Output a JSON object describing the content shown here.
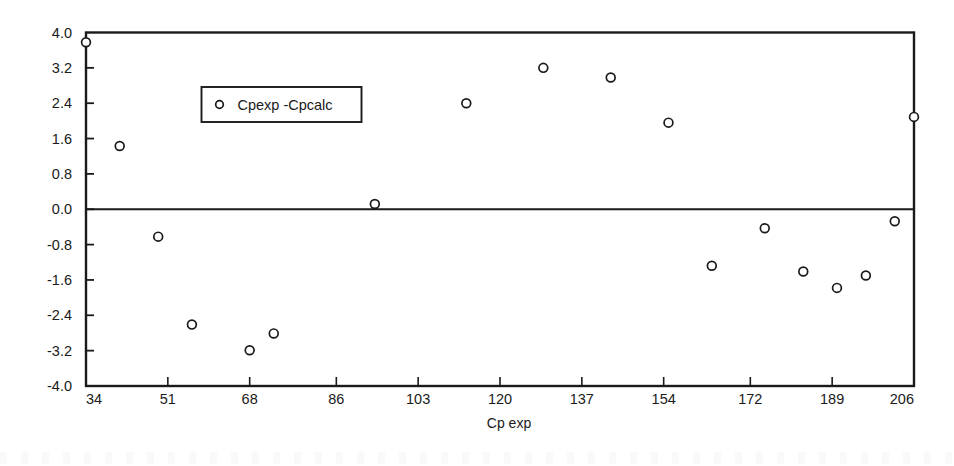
{
  "chart_data": {
    "type": "scatter",
    "title": "",
    "xlabel": "Cp exp",
    "ylabel": "",
    "xlim": [
      34,
      206
    ],
    "ylim": [
      -4.0,
      4.0
    ],
    "grid": false,
    "legend_position": "upper-left-inside",
    "xticks": [
      34,
      51,
      68,
      86,
      103,
      120,
      137,
      154,
      172,
      189,
      206
    ],
    "xticklabels": [
      "34",
      "51",
      "68",
      "86",
      "103",
      "120",
      "137",
      "154",
      "172",
      "189",
      "206"
    ],
    "yticks": [
      4.0,
      3.2,
      2.4,
      1.6,
      0.8,
      0.0,
      -0.8,
      -1.6,
      -2.4,
      -3.2,
      -4.0
    ],
    "yticklabels": [
      "4.0",
      "3.2",
      "2.4",
      "1.6",
      "0.8",
      "0.0",
      "-0.8",
      "-1.6",
      "-2.4",
      "-3.2",
      "-4.0"
    ],
    "zero_line": 0.0,
    "marker": "circle-open",
    "series": [
      {
        "name": "Cpexp -Cpcalc",
        "points": [
          {
            "x": 34,
            "y": 3.78
          },
          {
            "x": 41,
            "y": 1.43
          },
          {
            "x": 49,
            "y": -0.62
          },
          {
            "x": 56,
            "y": -2.61
          },
          {
            "x": 68,
            "y": -3.19
          },
          {
            "x": 73,
            "y": -2.81
          },
          {
            "x": 94,
            "y": 0.12
          },
          {
            "x": 113,
            "y": 2.4
          },
          {
            "x": 129,
            "y": 3.2
          },
          {
            "x": 143,
            "y": 2.98
          },
          {
            "x": 155,
            "y": 1.96
          },
          {
            "x": 164,
            "y": -1.28
          },
          {
            "x": 175,
            "y": -0.43
          },
          {
            "x": 183,
            "y": -1.41
          },
          {
            "x": 190,
            "y": -1.78
          },
          {
            "x": 196,
            "y": -1.5
          },
          {
            "x": 202,
            "y": -0.27
          },
          {
            "x": 206,
            "y": 2.09
          }
        ]
      }
    ]
  },
  "legend": {
    "entries": [
      {
        "label": "Cpexp -Cpcalc",
        "marker": "circle-open"
      }
    ]
  },
  "axes": {
    "x_axis_label": "Cp exp"
  },
  "style": {
    "frame_color": "#1a1a1a",
    "marker_edge_color": "#1a1a1a",
    "marker_face_color": "#ffffff",
    "text_color": "#1a1a1a",
    "background": "#ffffff"
  }
}
